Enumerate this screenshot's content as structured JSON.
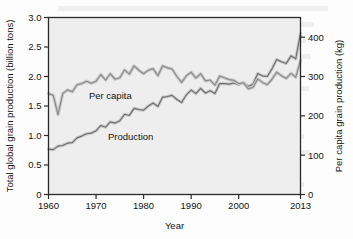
{
  "chart_data": {
    "type": "line",
    "title": "",
    "xlabel": "Year",
    "ylabel": "Total global grain production (billion tons)",
    "ylabel_right": "Per capita grain production (kg)",
    "xlim": [
      1960,
      2013
    ],
    "ylim": [
      0,
      3.0
    ],
    "ylim_right": [
      0,
      450
    ],
    "grid": false,
    "legend_position": "inline-annotations",
    "xticks": [
      "1960",
      "1970",
      "1980",
      "1990",
      "2000",
      "2013"
    ],
    "xtick_values": [
      1960,
      1970,
      1980,
      1990,
      2000,
      2013
    ],
    "yticks_left": [
      "0",
      "0.5",
      "1.0",
      "1.5",
      "2.0",
      "2.5",
      "3.0"
    ],
    "ytick_values_left": [
      0,
      0.5,
      1.0,
      1.5,
      2.0,
      2.5,
      3.0
    ],
    "yticks_right": [
      "0",
      "100",
      "200",
      "300",
      "400"
    ],
    "ytick_values_right": [
      0,
      100,
      200,
      300,
      400
    ],
    "annotations": [
      {
        "text": "Per capita",
        "x": 1968.5,
        "y": 1.62
      },
      {
        "text": "Production",
        "x": 1972.5,
        "y": 0.93
      }
    ],
    "series": [
      {
        "name": "Production",
        "label": "Production",
        "axis": "left",
        "units": "billion tons",
        "color": "#6e6e6e",
        "x": [
          1960,
          1961,
          1962,
          1963,
          1964,
          1965,
          1966,
          1967,
          1968,
          1969,
          1970,
          1971,
          1972,
          1973,
          1974,
          1975,
          1976,
          1977,
          1978,
          1979,
          1980,
          1981,
          1982,
          1983,
          1984,
          1985,
          1986,
          1987,
          1988,
          1989,
          1990,
          1991,
          1992,
          1993,
          1994,
          1995,
          1996,
          1997,
          1998,
          1999,
          2000,
          2001,
          2002,
          2003,
          2004,
          2005,
          2006,
          2007,
          2008,
          2009,
          2010,
          2011,
          2012,
          2013
        ],
        "values": [
          0.77,
          0.76,
          0.82,
          0.83,
          0.87,
          0.88,
          0.96,
          0.99,
          1.03,
          1.04,
          1.08,
          1.17,
          1.14,
          1.23,
          1.21,
          1.25,
          1.36,
          1.34,
          1.46,
          1.44,
          1.43,
          1.5,
          1.55,
          1.49,
          1.65,
          1.66,
          1.68,
          1.61,
          1.56,
          1.69,
          1.77,
          1.71,
          1.8,
          1.72,
          1.76,
          1.71,
          1.88,
          1.88,
          1.87,
          1.89,
          1.86,
          1.9,
          1.83,
          1.87,
          2.05,
          2.01,
          2.0,
          2.13,
          2.29,
          2.25,
          2.22,
          2.35,
          2.3,
          2.73
        ]
      },
      {
        "name": "Per capita",
        "label": "Per capita",
        "axis": "right",
        "units": "kg",
        "color": "#8a8a8a",
        "x": [
          1960,
          1961,
          1962,
          1963,
          1964,
          1965,
          1966,
          1967,
          1968,
          1969,
          1970,
          1971,
          1972,
          1973,
          1974,
          1975,
          1976,
          1977,
          1978,
          1979,
          1980,
          1981,
          1982,
          1983,
          1984,
          1985,
          1986,
          1987,
          1988,
          1989,
          1990,
          1991,
          1992,
          1993,
          1994,
          1995,
          1996,
          1997,
          1998,
          1999,
          2000,
          2001,
          2002,
          2003,
          2004,
          2005,
          2006,
          2007,
          2008,
          2009,
          2010,
          2011,
          2012,
          2013
        ],
        "values": [
          257,
          252,
          203,
          257,
          266,
          261,
          279,
          282,
          288,
          283,
          288,
          305,
          291,
          307,
          293,
          297,
          317,
          306,
          327,
          316,
          307,
          316,
          320,
          302,
          327,
          322,
          319,
          300,
          285,
          302,
          311,
          296,
          307,
          289,
          291,
          278,
          301,
          297,
          292,
          290,
          282,
          284,
          269,
          272,
          294,
          285,
          279,
          293,
          311,
          302,
          295,
          308,
          298,
          341
        ]
      }
    ]
  },
  "axes": {
    "x_title": "Year",
    "y_left_title": "Total global grain production (billion tons)",
    "y_right_title": "Per capita grain production (kg)"
  }
}
